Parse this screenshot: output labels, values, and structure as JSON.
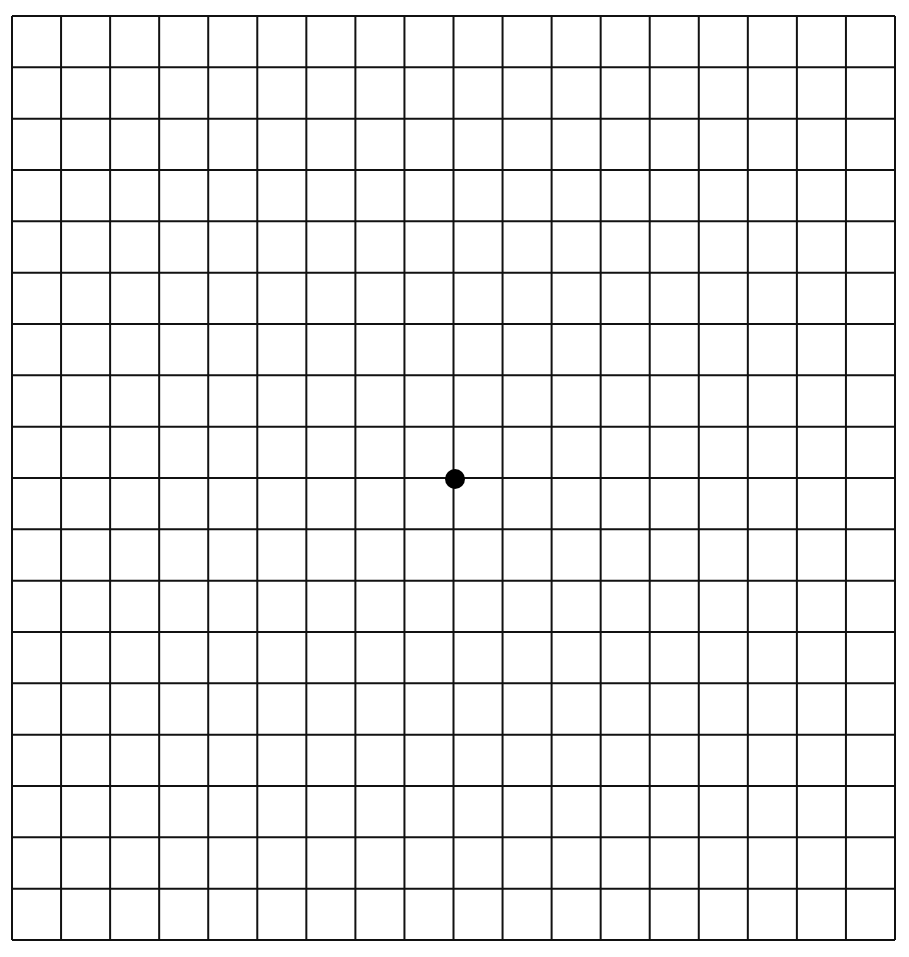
{
  "diagram": {
    "type": "amsler-grid",
    "columns": 18,
    "rows": 18,
    "grid": {
      "left": 12,
      "top": 16,
      "right": 895,
      "bottom": 940
    },
    "line_color": "#111111",
    "line_width": 2,
    "background": "#ffffff",
    "center_dot": {
      "cx": 455,
      "cy": 479,
      "r": 10,
      "color": "#000000"
    }
  }
}
